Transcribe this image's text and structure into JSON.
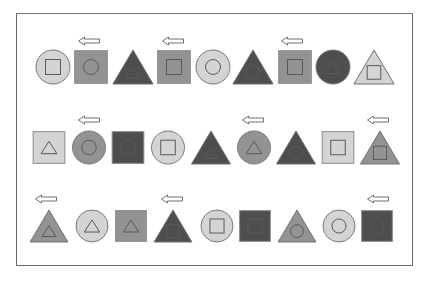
{
  "colors": {
    "light": "#d4d4d4",
    "medium": "#939393",
    "dark": "#4e4e4e",
    "stroke": "#5a5a5a",
    "arrow_stroke": "#6f6f6f",
    "frame": "#6a6a6a"
  },
  "rows": [
    {
      "y_top": 50,
      "size": 34,
      "arrow_y": 41,
      "arrows": [
        {
          "x": 89
        },
        {
          "x": 173
        },
        {
          "x": 292
        }
      ],
      "items": [
        {
          "outer": "circle",
          "outer_fill": "light",
          "inner": "square",
          "cx": 53
        },
        {
          "outer": "square",
          "outer_fill": "medium",
          "inner": "circle",
          "cx": 91
        },
        {
          "outer": "triangle",
          "outer_fill": "dark",
          "inner": "triangle",
          "cx": 133
        },
        {
          "outer": "square",
          "outer_fill": "medium",
          "inner": "square",
          "cx": 174
        },
        {
          "outer": "circle",
          "outer_fill": "light",
          "inner": "circle",
          "cx": 213
        },
        {
          "outer": "triangle",
          "outer_fill": "dark",
          "inner": "circle",
          "cx": 253
        },
        {
          "outer": "square",
          "outer_fill": "medium",
          "inner": "square",
          "cx": 295
        },
        {
          "outer": "circle",
          "outer_fill": "dark",
          "inner": "triangle",
          "cx": 333
        },
        {
          "outer": "triangle",
          "outer_fill": "light",
          "inner": "square",
          "cx": 374
        }
      ]
    },
    {
      "y_top": 131,
      "size": 33,
      "arrow_y": 120,
      "arrows": [
        {
          "x": 89
        },
        {
          "x": 253
        },
        {
          "x": 378
        }
      ],
      "items": [
        {
          "outer": "square",
          "outer_fill": "light",
          "inner": "triangle",
          "cx": 49
        },
        {
          "outer": "circle",
          "outer_fill": "medium",
          "inner": "circle",
          "cx": 89
        },
        {
          "outer": "square",
          "outer_fill": "dark",
          "inner": "circle",
          "cx": 128
        },
        {
          "outer": "circle",
          "outer_fill": "light",
          "inner": "square",
          "cx": 168
        },
        {
          "outer": "triangle",
          "outer_fill": "dark",
          "inner": "triangle",
          "cx": 211
        },
        {
          "outer": "circle",
          "outer_fill": "medium",
          "inner": "triangle",
          "cx": 254
        },
        {
          "outer": "triangle",
          "outer_fill": "dark",
          "inner": "circle",
          "cx": 296
        },
        {
          "outer": "square",
          "outer_fill": "light",
          "inner": "square",
          "cx": 338
        },
        {
          "outer": "triangle",
          "outer_fill": "medium",
          "inner": "square",
          "cx": 380
        }
      ]
    },
    {
      "y_top": 210,
      "size": 32,
      "arrow_y": 199,
      "arrows": [
        {
          "x": 46
        },
        {
          "x": 172
        },
        {
          "x": 378
        }
      ],
      "items": [
        {
          "outer": "triangle",
          "outer_fill": "medium",
          "inner": "triangle",
          "cx": 49
        },
        {
          "outer": "circle",
          "outer_fill": "light",
          "inner": "triangle",
          "cx": 92
        },
        {
          "outer": "square",
          "outer_fill": "medium",
          "inner": "triangle",
          "cx": 131
        },
        {
          "outer": "triangle",
          "outer_fill": "dark",
          "inner": "square",
          "cx": 173
        },
        {
          "outer": "circle",
          "outer_fill": "light",
          "inner": "square",
          "cx": 217
        },
        {
          "outer": "square",
          "outer_fill": "dark",
          "inner": "square",
          "cx": 255
        },
        {
          "outer": "triangle",
          "outer_fill": "medium",
          "inner": "circle",
          "cx": 297
        },
        {
          "outer": "circle",
          "outer_fill": "light",
          "inner": "circle",
          "cx": 339
        },
        {
          "outer": "square",
          "outer_fill": "dark",
          "inner": "circle",
          "cx": 377
        }
      ]
    }
  ]
}
